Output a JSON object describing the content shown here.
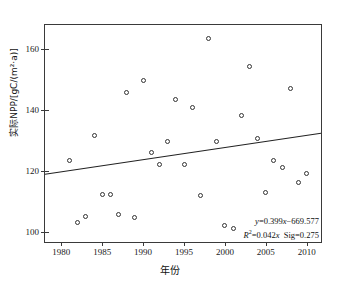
{
  "chart_data": {
    "type": "scatter",
    "title": "",
    "xlabel": "年份",
    "ylabel": "实际NPP/[gC/(m²·a)]",
    "xlim": [
      1978,
      2012
    ],
    "ylim": [
      96,
      168
    ],
    "xticks": [
      1980,
      1985,
      1990,
      1995,
      2000,
      2005,
      2010
    ],
    "yticks": [
      100,
      120,
      140,
      160
    ],
    "grid": false,
    "legend": "none",
    "marker": "open-circle",
    "x": [
      1981,
      1982,
      1983,
      1984,
      1985,
      1986,
      1987,
      1988,
      1989,
      1990,
      1991,
      1992,
      1993,
      1994,
      1995,
      1996,
      1997,
      1998,
      1999,
      2000,
      2001,
      2002,
      2003,
      2004,
      2005,
      2006,
      2007,
      2008,
      2009,
      2010
    ],
    "y": [
      123.6,
      103.2,
      105.0,
      131.6,
      112.2,
      112.3,
      105.8,
      145.7,
      104.8,
      149.7,
      126.2,
      122.2,
      129.7,
      143.4,
      122.2,
      140.8,
      112.0,
      163.7,
      129.7,
      102.0,
      101.2,
      138.1,
      154.3,
      130.8,
      112.8,
      123.6,
      121.2,
      147.1,
      116.1,
      119.2
    ],
    "trendline": {
      "equation": "y=0.399x−669.577",
      "r_squared_text": "R²=0.042x",
      "significance_text": "Sig=0.275",
      "slope": 0.399,
      "intercept": -669.577,
      "x_start": 1978,
      "x_end": 2012,
      "y_start": 118.5,
      "y_end": 132.1
    },
    "annotations": [
      "y=0.399x−669.577",
      "R²=0.042x  Sig=0.275"
    ]
  },
  "annotation": {
    "line1_prefix": "y",
    "line1_rest": "=0.399",
    "line1_var": "x",
    "line1_tail": "−669.577",
    "line2_r": "R",
    "line2_sup": "2",
    "line2_rest": "=0.042",
    "line2_var": "x",
    "line2_sig": "Sig=0.275"
  },
  "colors": {
    "axis": "#3a3a3a",
    "marker_stroke": "#333333",
    "marker_fill": "#ffffff",
    "trend_line": "#222222",
    "text": "#111111",
    "background": "#ffffff"
  }
}
